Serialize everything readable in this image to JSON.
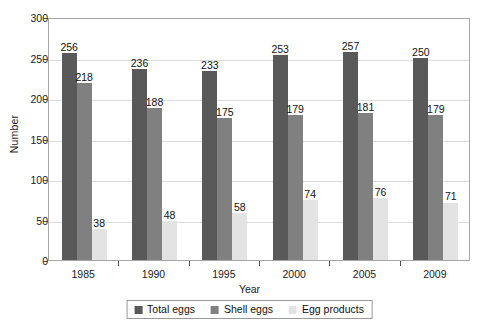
{
  "chart_data": {
    "type": "bar",
    "title": "",
    "xlabel": "Year",
    "ylabel": "Number",
    "categories": [
      "1985",
      "1990",
      "1995",
      "2000",
      "2005",
      "2009"
    ],
    "series": [
      {
        "name": "Total eggs",
        "color": "#595959",
        "values": [
          256,
          236,
          233,
          253,
          257,
          250
        ]
      },
      {
        "name": "Shell eggs",
        "color": "#808080",
        "values": [
          218,
          188,
          175,
          179,
          181,
          179
        ]
      },
      {
        "name": "Egg products",
        "color": "#e3e3e3",
        "values": [
          38,
          48,
          58,
          74,
          76,
          71
        ]
      }
    ],
    "ylim": [
      0,
      300
    ],
    "yticks": [
      0,
      50,
      100,
      150,
      200,
      250,
      300
    ],
    "ytick_labels": [
      "0",
      "50",
      "100",
      "150",
      "200",
      "250",
      "300"
    ],
    "grid": true,
    "legend_position": "bottom-center",
    "data_labels": true
  },
  "legend": {
    "items": [
      {
        "label": "Total eggs",
        "color": "#595959"
      },
      {
        "label": "Shell eggs",
        "color": "#808080"
      },
      {
        "label": "Egg products",
        "color": "#e3e3e3"
      }
    ]
  }
}
